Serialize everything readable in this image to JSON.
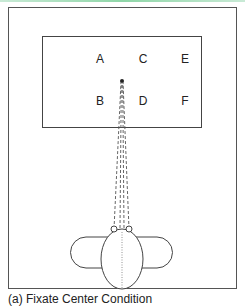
{
  "figure": {
    "labels": [
      {
        "id": "A",
        "text": "A",
        "x": 100,
        "y": 63
      },
      {
        "id": "C",
        "text": "C",
        "x": 143,
        "y": 63
      },
      {
        "id": "E",
        "text": "E",
        "x": 185,
        "y": 63
      },
      {
        "id": "B",
        "text": "B",
        "x": 100,
        "y": 105
      },
      {
        "id": "D",
        "text": "D",
        "x": 143,
        "y": 105
      },
      {
        "id": "F",
        "text": "F",
        "x": 185,
        "y": 105
      }
    ],
    "caption": "(a) Fixate Center Condition",
    "colors": {
      "stroke": "#444444",
      "accent_line": "#8fd6a8"
    }
  }
}
